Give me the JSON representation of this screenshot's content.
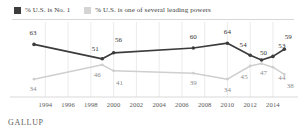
{
  "legend": {
    "entries": [
      {
        "label": "% U.S. is No. 1",
        "color": "#3c3c3c",
        "swatch": "legend-swatch-dark"
      },
      {
        "label": "% U.S. is one of several leading powers",
        "color": "#cfcfcf",
        "swatch": "legend-swatch-light"
      }
    ]
  },
  "footer": {
    "brand": "GALLUP"
  },
  "chart_data": {
    "type": "line",
    "title": "",
    "subtitle": "",
    "xlabel": "",
    "ylabel": "",
    "grid": "vertical",
    "legend_position": "top-left",
    "xlim": [
      1993,
      2015.5
    ],
    "ylim": [
      25,
      70
    ],
    "tick_labels": [
      "1994",
      "1996",
      "1998",
      "2000",
      "2002",
      "2004",
      "2006",
      "2008",
      "2010",
      "2012",
      "2014"
    ],
    "ticks": [
      1994,
      1996,
      1998,
      2000,
      2002,
      2004,
      2006,
      2008,
      2010,
      2012,
      2014
    ],
    "series": [
      {
        "name": "% U.S. is No. 1",
        "color": "#3c3c3c",
        "x": [
          1993,
          1999,
          2000,
          2007,
          2010,
          2012,
          2013,
          2014,
          2015
        ],
        "values": [
          63,
          51,
          56,
          60,
          64,
          54,
          50,
          53,
          59
        ],
        "labels": [
          "63",
          "51",
          "56",
          "60",
          "64",
          "54",
          "50",
          "53",
          "59"
        ]
      },
      {
        "name": "% U.S. is one of several leading powers",
        "color": "#cfcfcf",
        "x": [
          1993,
          1999,
          2000,
          2007,
          2010,
          2012,
          2013,
          2014,
          2015
        ],
        "values": [
          34,
          46,
          41,
          39,
          34,
          45,
          47,
          44,
          38
        ],
        "labels": [
          "34",
          "46",
          "41",
          "39",
          "34",
          "45",
          "47",
          "44",
          "38"
        ]
      }
    ]
  }
}
